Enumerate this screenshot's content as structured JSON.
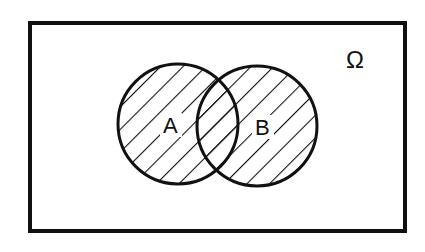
{
  "diagram": {
    "type": "venn",
    "universe_label": "Ω",
    "sets": [
      {
        "label": "A"
      },
      {
        "label": "B"
      }
    ],
    "shaded_region": "A ∪ B",
    "colors": {
      "stroke": "#111111",
      "background": "#ffffff"
    }
  }
}
